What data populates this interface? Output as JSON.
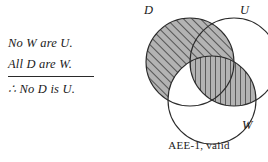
{
  "syllogism": {
    "premise_major": "No W are U.",
    "premise_minor": "All D are W.",
    "conclusion": "∴ No D is U."
  },
  "diagram": {
    "labels": {
      "circle_d": "D",
      "circle_u": "U",
      "circle_w": "W"
    },
    "caption": "AEE-1, valid",
    "colors": {
      "stroke": "#2b2b2b",
      "shade_fill": "#b3b3b3",
      "hatch_line": "#3a3a3a",
      "background": "#ffffff",
      "text": "#1a1a1a"
    },
    "regions": [
      {
        "id": "d-only",
        "label": "D only",
        "shading": "diagonal"
      },
      {
        "id": "d-and-u",
        "label": "D ∩ U",
        "shading": "diagonal"
      },
      {
        "id": "u-and-w",
        "label": "U ∩ W",
        "shading": "vertical"
      },
      {
        "id": "d-u-w",
        "label": "D ∩ U ∩ W",
        "shading": "vertical"
      },
      {
        "id": "d-and-w",
        "label": "D ∩ W",
        "shading": "none"
      },
      {
        "id": "u-only",
        "label": "U only",
        "shading": "none"
      },
      {
        "id": "w-only",
        "label": "W only",
        "shading": "none"
      }
    ],
    "geometry": {
      "circle_d": {
        "cx": 60,
        "cy": 62,
        "r": 44
      },
      "circle_u": {
        "cx": 104,
        "cy": 62,
        "r": 44
      },
      "circle_w": {
        "cx": 82,
        "cy": 100,
        "r": 44
      }
    }
  }
}
